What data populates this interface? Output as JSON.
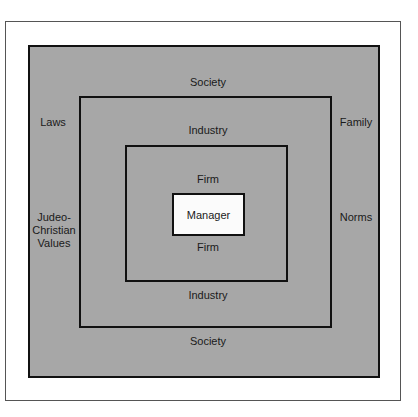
{
  "diagram": {
    "layers": [
      {
        "name": "Society",
        "top_label": "Society",
        "bottom_label": "Society"
      },
      {
        "name": "Industry",
        "top_label": "Industry",
        "bottom_label": "Industry"
      },
      {
        "name": "Firm",
        "top_label": "Firm",
        "bottom_label": "Firm"
      }
    ],
    "center": {
      "label": "Manager"
    },
    "left_labels": {
      "upper": "Laws",
      "lower_line1": "Judeo-",
      "lower_line2": "Christian",
      "lower_line3": "Values"
    },
    "right_labels": {
      "upper": "Family",
      "lower": "Norms"
    },
    "colors": {
      "fill": "#a7a7a7",
      "border": "#111111",
      "center_fill": "#fbfbfb"
    }
  }
}
